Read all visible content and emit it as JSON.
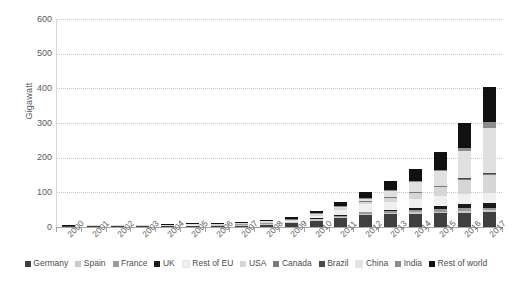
{
  "chart_data": {
    "type": "bar",
    "subtype": "stacked-bar",
    "title": "",
    "xlabel": "",
    "ylabel": "Gigawatt",
    "ylim": [
      0,
      600
    ],
    "ytick_step": 100,
    "yticks": [
      0,
      100,
      200,
      300,
      400,
      500,
      600
    ],
    "ytick_labels": [
      "0",
      "100",
      "200",
      "300",
      "400",
      "500",
      "600"
    ],
    "grid": true,
    "grid_axis": "y",
    "legend_position": "bottom",
    "categories": [
      "2000",
      "2001",
      "2002",
      "2003",
      "2004",
      "2005",
      "2006",
      "2007",
      "2008",
      "2009",
      "2010",
      "2011",
      "2012",
      "2013",
      "2014",
      "2015",
      "2016",
      "2017"
    ],
    "series": [
      {
        "name": "Germany",
        "color": "#3f3f3f",
        "values": [
          0.1,
          0.2,
          0.3,
          0.5,
          1.1,
          2.0,
          2.9,
          4.2,
          6.2,
          10.6,
          18.0,
          25.9,
          34.1,
          36.3,
          38.2,
          39.7,
          41.2,
          42.4
        ]
      },
      {
        "name": "Spain",
        "color": "#c9c9c9",
        "values": [
          0.0,
          0.0,
          0.0,
          0.0,
          0.0,
          0.1,
          0.2,
          0.7,
          3.4,
          3.5,
          3.9,
          4.3,
          4.6,
          4.7,
          4.7,
          4.9,
          5.5,
          5.6
        ]
      },
      {
        "name": "France",
        "color": "#9a9a9a",
        "values": [
          0.0,
          0.0,
          0.0,
          0.0,
          0.0,
          0.0,
          0.0,
          0.1,
          0.2,
          0.4,
          1.1,
          2.9,
          4.1,
          4.7,
          5.7,
          6.8,
          7.2,
          8.0
        ]
      },
      {
        "name": "UK",
        "color": "#1a1a1a",
        "values": [
          0.0,
          0.0,
          0.0,
          0.0,
          0.0,
          0.0,
          0.0,
          0.0,
          0.0,
          0.0,
          0.1,
          1.0,
          1.8,
          2.9,
          5.5,
          9.6,
          11.9,
          12.8
        ]
      },
      {
        "name": "Rest of EU",
        "color": "#f0f0f0",
        "values": [
          0.0,
          0.1,
          0.1,
          0.1,
          0.2,
          0.3,
          0.4,
          0.7,
          1.4,
          3.0,
          6.5,
          14.4,
          21.3,
          24.5,
          26.5,
          28.0,
          29.4,
          30.6
        ]
      },
      {
        "name": "USA",
        "color": "#d6d6d6",
        "values": [
          0.1,
          0.2,
          0.2,
          0.3,
          0.4,
          0.5,
          0.6,
          0.8,
          1.2,
          1.6,
          2.5,
          4.4,
          7.8,
          12.1,
          18.3,
          25.6,
          40.3,
          51.0
        ]
      },
      {
        "name": "Canada",
        "color": "#7a7a7a",
        "values": [
          0.0,
          0.0,
          0.0,
          0.0,
          0.0,
          0.0,
          0.0,
          0.0,
          0.0,
          0.1,
          0.2,
          0.5,
          0.8,
          1.2,
          1.8,
          2.5,
          2.9,
          3.0
        ]
      },
      {
        "name": "Brazil",
        "color": "#4a4a4a",
        "values": [
          0.0,
          0.0,
          0.0,
          0.0,
          0.0,
          0.0,
          0.0,
          0.0,
          0.0,
          0.0,
          0.0,
          0.0,
          0.0,
          0.0,
          0.0,
          0.0,
          0.1,
          1.1
        ]
      },
      {
        "name": "China",
        "color": "#e0e0e0",
        "values": [
          0.0,
          0.0,
          0.0,
          0.0,
          0.1,
          0.1,
          0.1,
          0.1,
          0.2,
          0.3,
          0.8,
          3.3,
          6.7,
          17.7,
          28.4,
          43.5,
          77.8,
          131.1
        ]
      },
      {
        "name": "India",
        "color": "#8c8c8c",
        "values": [
          0.0,
          0.0,
          0.0,
          0.0,
          0.0,
          0.0,
          0.0,
          0.0,
          0.0,
          0.0,
          0.1,
          0.5,
          1.2,
          2.3,
          3.3,
          5.0,
          9.0,
          18.3
        ]
      },
      {
        "name": "Rest of world",
        "color": "#111111",
        "values": [
          0.2,
          0.3,
          0.4,
          0.6,
          0.9,
          1.3,
          1.8,
          2.5,
          3.8,
          5.5,
          7.8,
          12.0,
          17.5,
          25.0,
          35.0,
          50.0,
          74.0,
          99.0
        ]
      }
    ],
    "totals": [
      0.4,
      0.8,
      1.0,
      1.5,
      2.7,
      4.3,
      6.0,
      9.1,
      16.4,
      25.0,
      41.0,
      69.2,
      99.9,
      131.4,
      167.4,
      215.6,
      299.3,
      402.9
    ]
  },
  "axes": {
    "y_title": "Gigawatt"
  },
  "legend": {
    "items": [
      {
        "label": "Germany",
        "color": "#3f3f3f"
      },
      {
        "label": "Spain",
        "color": "#c9c9c9"
      },
      {
        "label": "France",
        "color": "#9a9a9a"
      },
      {
        "label": "UK",
        "color": "#1a1a1a"
      },
      {
        "label": "Rest of EU",
        "color": "#f0f0f0"
      },
      {
        "label": "USA",
        "color": "#d6d6d6"
      },
      {
        "label": "Canada",
        "color": "#7a7a7a"
      },
      {
        "label": "Brazil",
        "color": "#4a4a4a"
      },
      {
        "label": "China",
        "color": "#e0e0e0"
      },
      {
        "label": "India",
        "color": "#8c8c8c"
      },
      {
        "label": "Rest of world",
        "color": "#111111"
      }
    ]
  }
}
